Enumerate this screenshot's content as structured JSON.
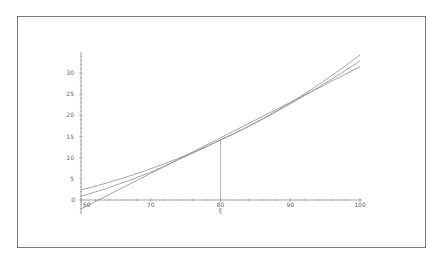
{
  "chart_data": {
    "type": "line",
    "title": "",
    "xlabel": "",
    "ylabel": "",
    "xlim": [
      60,
      100
    ],
    "ylim": [
      -3,
      35
    ],
    "x_ticks": [
      "60",
      "70",
      "80",
      "90",
      "100"
    ],
    "y_ticks": [
      "0",
      "5",
      "10",
      "15",
      "20",
      "25",
      "30"
    ],
    "annotation": {
      "x": 80,
      "label": "ξ",
      "y": 14.2
    },
    "grid": false,
    "legend": null,
    "series": [
      {
        "name": "curve-upper",
        "x": [
          60,
          70,
          80,
          90,
          100
        ],
        "values": [
          2.4,
          7.4,
          14.2,
          23.0,
          34.3
        ]
      },
      {
        "name": "curve-middle",
        "x": [
          60,
          70,
          80,
          90,
          100
        ],
        "values": [
          0.9,
          6.6,
          14.2,
          22.7,
          32.9
        ]
      },
      {
        "name": "tangent-line",
        "x": [
          60,
          100
        ],
        "values": [
          -2.1,
          31.5
        ]
      }
    ],
    "colors": {
      "lines": "#8c8c8c",
      "axis": "#8c8c8c",
      "frame": "#7a7a7a"
    }
  }
}
